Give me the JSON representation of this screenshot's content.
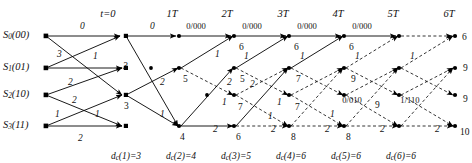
{
  "figure": {
    "type": "viterbi-trellis-diagram",
    "width": 472,
    "height": 163,
    "background": "#ffffff",
    "line_color": "#000000"
  },
  "time_axis": {
    "labels": [
      "t=0",
      "1T",
      "2T",
      "3T",
      "4T",
      "5T",
      "6T"
    ],
    "x": [
      108,
      172,
      227,
      283,
      338,
      393,
      449
    ],
    "y": 9
  },
  "states": {
    "labels": [
      "S0(00)",
      "S1(01)",
      "S2(10)",
      "S3(11)"
    ],
    "sub": [
      "0",
      "1",
      "2",
      "3"
    ],
    "paren": [
      "(00)",
      "(01)",
      "(10)",
      "(11)"
    ],
    "rows_y": [
      36,
      68,
      95,
      126
    ],
    "x": 3
  },
  "columns_x": [
    46,
    126,
    181,
    236,
    291,
    346,
    401,
    456
  ],
  "bottom_metrics": {
    "labels": [
      "dc(1)=3",
      "dc(2)=4",
      "dc(3)=5",
      "dc(4)=6",
      "dc(5)=6",
      "dc(6)=6"
    ],
    "prefix": "d",
    "sub": "c",
    "args": [
      "(1)=3",
      "(2)=4",
      "(3)=5",
      "(4)=6",
      "(5)=6",
      "(6)=6"
    ],
    "x": [
      126,
      181,
      236,
      291,
      346,
      401
    ],
    "y": 152
  },
  "initial_branch_labels": [
    {
      "text": "0",
      "x": 80,
      "y": 22
    },
    {
      "text": "3",
      "x": 57,
      "y": 50
    },
    {
      "text": "1",
      "x": 93,
      "y": 52
    },
    {
      "text": "2",
      "x": 68,
      "y": 78
    },
    {
      "text": "2",
      "x": 72,
      "y": 96
    },
    {
      "text": "1",
      "x": 55,
      "y": 110
    },
    {
      "text": "1",
      "x": 95,
      "y": 110
    },
    {
      "text": "2",
      "x": 78,
      "y": 134
    }
  ],
  "branch_labels": [
    {
      "text": "0",
      "x": 150,
      "y": 22
    },
    {
      "text": "3",
      "x": 123,
      "y": 62
    },
    {
      "text": "0/000",
      "x": 196,
      "y": 22
    },
    {
      "text": "0/000",
      "x": 252,
      "y": 22
    },
    {
      "text": "0/000",
      "x": 307,
      "y": 22
    },
    {
      "text": "0/000",
      "x": 362,
      "y": 22
    },
    {
      "text": "2",
      "x": 160,
      "y": 78
    },
    {
      "text": "1",
      "x": 160,
      "y": 110
    },
    {
      "text": "1",
      "x": 215,
      "y": 50
    },
    {
      "text": "2",
      "x": 227,
      "y": 78
    },
    {
      "text": "1",
      "x": 222,
      "y": 98
    },
    {
      "text": "2",
      "x": 213,
      "y": 125
    },
    {
      "text": "1",
      "x": 244,
      "y": 52
    },
    {
      "text": "2",
      "x": 250,
      "y": 80
    },
    {
      "text": "2",
      "x": 271,
      "y": 125
    },
    {
      "text": "1",
      "x": 277,
      "y": 98
    },
    {
      "text": "1",
      "x": 300,
      "y": 52
    },
    {
      "text": "1",
      "x": 268,
      "y": 112
    },
    {
      "text": "2",
      "x": 325,
      "y": 125
    },
    {
      "text": "1",
      "x": 330,
      "y": 110
    },
    {
      "text": "1",
      "x": 355,
      "y": 52
    },
    {
      "text": "2",
      "x": 380,
      "y": 125
    },
    {
      "text": "1",
      "x": 410,
      "y": 52
    },
    {
      "text": "2",
      "x": 435,
      "y": 125
    },
    {
      "text": "0/010",
      "x": 352,
      "y": 96
    },
    {
      "text": "1/110",
      "x": 410,
      "y": 96
    }
  ],
  "node_metrics": [
    {
      "text": "3",
      "x": 124,
      "y": 102
    },
    {
      "text": "5",
      "x": 183,
      "y": 75
    },
    {
      "text": "4",
      "x": 180,
      "y": 133
    },
    {
      "text": "6",
      "x": 239,
      "y": 43
    },
    {
      "text": "5",
      "x": 240,
      "y": 75
    },
    {
      "text": "7",
      "x": 238,
      "y": 103
    },
    {
      "text": "6",
      "x": 236,
      "y": 133
    },
    {
      "text": "6",
      "x": 294,
      "y": 43
    },
    {
      "text": "7",
      "x": 296,
      "y": 75
    },
    {
      "text": "7",
      "x": 295,
      "y": 103
    },
    {
      "text": "8",
      "x": 291,
      "y": 133
    },
    {
      "text": "6",
      "x": 349,
      "y": 43
    },
    {
      "text": "9",
      "x": 351,
      "y": 75
    },
    {
      "text": "9",
      "x": 375,
      "y": 101
    },
    {
      "text": "8",
      "x": 346,
      "y": 133
    },
    {
      "text": "6",
      "x": 462,
      "y": 33
    },
    {
      "text": "9",
      "x": 463,
      "y": 64
    },
    {
      "text": "9",
      "x": 463,
      "y": 95
    },
    {
      "text": "10",
      "x": 460,
      "y": 128
    }
  ],
  "accent": {
    "survivor_path": "#000000",
    "discarded_path": "#000000"
  }
}
